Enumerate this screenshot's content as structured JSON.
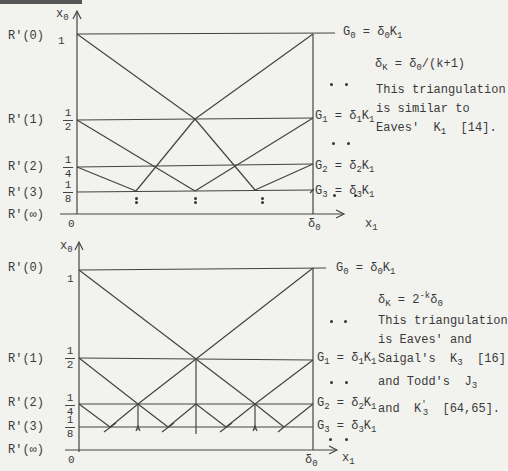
{
  "figures": [
    {
      "id": "top",
      "y_axis_label": "x",
      "y_axis_sub": "0",
      "x_axis_label": "x",
      "x_axis_sub": "1",
      "origin_label": "0",
      "x_end_label": "δ",
      "x_end_sub": "0",
      "row_labels": [
        "R'(0)",
        "R'(1)",
        "R'(2)",
        "R'(3)",
        "R'(∞)"
      ],
      "tick_labels": [
        {
          "num": "1",
          "den": ""
        },
        {
          "num": "1",
          "den": "2"
        },
        {
          "num": "1",
          "den": "4"
        },
        {
          "num": "1",
          "den": "8"
        }
      ],
      "level_labels": [
        {
          "g": "G",
          "gs": "0",
          "d": "δ",
          "ds": "0",
          "k": "K",
          "ks": "1"
        },
        {
          "g": "G",
          "gs": "1",
          "d": "δ",
          "ds": "1",
          "k": "K",
          "ks": "1"
        },
        {
          "g": "G",
          "gs": "2",
          "d": "δ",
          "ds": "2",
          "k": "K",
          "ks": "1"
        },
        {
          "g": "G",
          "gs": "3",
          "d": "δ",
          "ds": "3",
          "k": "K",
          "ks": "1"
        }
      ],
      "formula": {
        "lhs": "δ",
        "lhs_sub": "K",
        "rhs": " = δ",
        "rhs_sub": "0",
        "rhs_tail": "/(k+1)"
      },
      "note_lines": [
        "This triangulation",
        "is similar to",
        "Eaves'  K"
      ],
      "note_tail": {
        "sub": "1",
        "ref": "  [14]."
      }
    },
    {
      "id": "bottom",
      "y_axis_label": "x",
      "y_axis_sub": "0",
      "x_axis_label": "x",
      "x_axis_sub": "1",
      "origin_label": "0",
      "x_end_label": "δ",
      "x_end_sub": "0",
      "row_labels": [
        "R'(0)",
        "R'(1)",
        "R'(2)",
        "R'(3)",
        "R'(∞)"
      ],
      "tick_labels": [
        {
          "num": "1",
          "den": ""
        },
        {
          "num": "1",
          "den": "2"
        },
        {
          "num": "1",
          "den": "4"
        },
        {
          "num": "1",
          "den": "8"
        }
      ],
      "level_labels": [
        {
          "g": "G",
          "gs": "0",
          "d": "δ",
          "ds": "0",
          "k": "K",
          "ks": "1"
        },
        {
          "g": "G",
          "gs": "1",
          "d": "δ",
          "ds": "1",
          "k": "K",
          "ks": "1"
        },
        {
          "g": "G",
          "gs": "2",
          "d": "δ",
          "ds": "2",
          "k": "K",
          "ks": "1"
        },
        {
          "g": "G",
          "gs": "3",
          "d": "δ",
          "ds": "3",
          "k": "K",
          "ks": "1"
        }
      ],
      "formula": {
        "lhs": "δ",
        "lhs_sub": "K",
        "rhs": " = 2",
        "rhs_sup": "-k",
        "rhs_tail": "δ",
        "rhs_tail_sub": "0"
      },
      "note_lines": [
        "This triangulation",
        "is Eaves' and",
        "Saigal's  K",
        "and Todd's  J",
        "and  K"
      ],
      "note_extras": {
        "saigal_sub": "3",
        "saigal_ref": "  [16]",
        "todd_sub": "3",
        "k_sub": "3",
        "k_sup": "'",
        "k_ref": "  [64,65]."
      }
    }
  ]
}
